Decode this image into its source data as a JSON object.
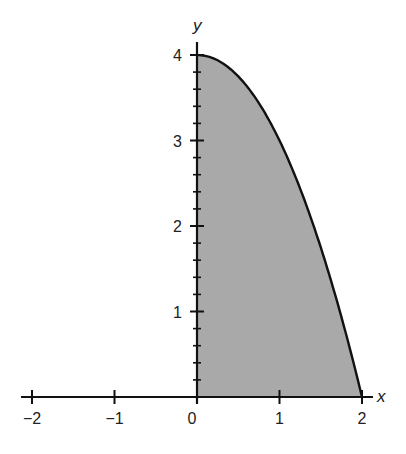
{
  "chart_data": {
    "type": "area",
    "title": "",
    "xlabel": "x",
    "ylabel": "y",
    "function": "y = 4 - x^2",
    "x": [
      0,
      0.25,
      0.5,
      0.75,
      1,
      1.25,
      1.5,
      1.75,
      2
    ],
    "values": [
      4,
      3.9375,
      3.75,
      3.4375,
      3,
      2.4375,
      1.75,
      0.9375,
      0
    ],
    "fill_region": "area under curve from x=0 to x=2",
    "xlim": [
      -2.2,
      2.2
    ],
    "ylim": [
      0,
      4.3
    ],
    "x_ticks": [
      "-2",
      "-1",
      "0",
      "1",
      "2"
    ],
    "y_ticks": [
      "1",
      "2",
      "3",
      "4"
    ],
    "y_minor_tick_step": 0.2,
    "grid": false,
    "fill_color": "#a9a9a9",
    "line_color": "#111111"
  },
  "labels": {
    "x_axis": "x",
    "y_axis": "y",
    "x_ticks": [
      "−2",
      "−1",
      "0",
      "1",
      "2"
    ],
    "y_ticks": [
      "1",
      "2",
      "3",
      "4"
    ]
  }
}
